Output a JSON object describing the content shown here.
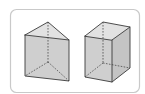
{
  "figure": {
    "shapes": [
      {
        "name": "triangular-prism",
        "label": "Triangular prism",
        "faces": 5,
        "edges": 9,
        "vertices": 6
      },
      {
        "name": "rectangular-prism",
        "label": "Rectangular prism",
        "faces": 6,
        "edges": 12,
        "vertices": 8
      }
    ],
    "colors": {
      "frame": "#c9c9c9",
      "face_fill": "#cfcfcf",
      "top_fill": "#e2e2e2",
      "edge": "#3a3a3a"
    }
  }
}
